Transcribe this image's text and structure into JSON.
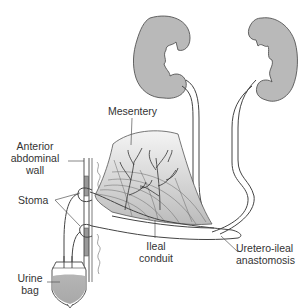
{
  "diagram": {
    "labels": {
      "mesentery": "Mesentery",
      "anterior_abdominal_wall": [
        "Anterior",
        "abdominal",
        "wall"
      ],
      "stoma": "Stoma",
      "ileal_conduit": [
        "Ileal",
        "conduit"
      ],
      "uretero_ileal_anastomosis": [
        "Uretero-ileal",
        "anastomosis"
      ],
      "urine_bag": [
        "Urine",
        "bag"
      ]
    },
    "structures": [
      "left-kidney",
      "right-kidney",
      "left-ureter",
      "right-ureter",
      "ileal-segment",
      "mesentery",
      "abdominal-wall",
      "stoma",
      "urine-bag"
    ],
    "colors": {
      "organ_fill": "#b9b9b9",
      "outline": "#444444",
      "mesentery_fill_light": "#f2f2f2",
      "mesentery_fill_dark": "#bdbdbd"
    }
  }
}
